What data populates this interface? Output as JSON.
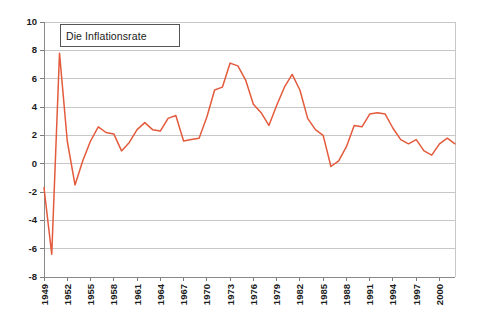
{
  "chart_data": {
    "type": "line",
    "title": "Die Inflationsrate",
    "xlabel": "",
    "ylabel": "",
    "ylim": [
      -8,
      10
    ],
    "ytick_step": 2,
    "yticks": [
      10,
      8,
      6,
      4,
      2,
      0,
      -2,
      -4,
      -6,
      -8
    ],
    "grid": true,
    "grid_axis": "y",
    "legend": false,
    "legend_position": "none",
    "series_color": "#e35a3c",
    "xtick_labels": [
      "1949",
      "1952",
      "1955",
      "1958",
      "1961",
      "1964",
      "1967",
      "1970",
      "1973",
      "1976",
      "1979",
      "1982",
      "1985",
      "1988",
      "1991",
      "1994",
      "1997",
      "2000"
    ],
    "xtick_step_years": 3,
    "x": [
      1949,
      1950,
      1951,
      1952,
      1953,
      1954,
      1955,
      1956,
      1957,
      1958,
      1959,
      1960,
      1961,
      1962,
      1963,
      1964,
      1965,
      1966,
      1967,
      1968,
      1969,
      1970,
      1971,
      1972,
      1973,
      1974,
      1975,
      1976,
      1977,
      1978,
      1979,
      1980,
      1981,
      1982,
      1983,
      1984,
      1985,
      1986,
      1987,
      1988,
      1989,
      1990,
      1991,
      1992,
      1993,
      1994,
      1995,
      1996,
      1997,
      1998,
      1999,
      2000,
      2001,
      2002
    ],
    "series": [
      {
        "name": "Die Inflationsrate",
        "values": [
          -1.7,
          -6.4,
          7.8,
          1.6,
          -1.5,
          0.2,
          1.6,
          2.6,
          2.2,
          2.1,
          0.9,
          1.5,
          2.4,
          2.9,
          2.4,
          2.3,
          3.2,
          3.4,
          1.6,
          1.7,
          1.8,
          3.3,
          5.2,
          5.4,
          7.1,
          6.9,
          5.9,
          4.2,
          3.6,
          2.7,
          4.1,
          5.4,
          6.3,
          5.2,
          3.2,
          2.4,
          2.0,
          -0.2,
          0.2,
          1.2,
          2.7,
          2.6,
          3.5,
          3.6,
          3.5,
          2.5,
          1.7,
          1.4,
          1.7,
          0.9,
          0.6,
          1.4,
          1.8,
          1.4
        ]
      }
    ]
  },
  "plot": {
    "left": 44,
    "right": 455,
    "top": 22,
    "bottom": 277
  }
}
